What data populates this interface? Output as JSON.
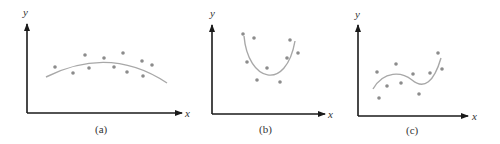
{
  "chart_data": [
    {
      "type": "scatter",
      "caption": "(a)",
      "xlabel": "x",
      "ylabel": "y",
      "description": "Scatter points with a quadratic (concave-down) fitted curve",
      "points": [
        [
          55,
          67
        ],
        [
          73,
          73
        ],
        [
          85,
          55
        ],
        [
          89,
          68
        ],
        [
          104,
          58
        ],
        [
          114,
          67
        ],
        [
          123,
          53
        ],
        [
          127,
          72
        ],
        [
          142,
          61
        ],
        [
          143,
          76
        ],
        [
          152,
          65
        ]
      ],
      "curve": "M46,77 Q110,45 167,83",
      "axes": {
        "origin": [
          27,
          113
        ],
        "y_top": 24,
        "x_right": 182
      },
      "labels": {
        "y_pos": [
          26,
          15
        ],
        "x_pos": [
          188,
          116
        ],
        "caption_pos": [
          103,
          132
        ]
      }
    },
    {
      "type": "scatter",
      "caption": "(b)",
      "xlabel": "x",
      "ylabel": "y",
      "description": "Scatter points with a U-shaped (concave-up) fitted curve",
      "points": [
        [
          243,
          34
        ],
        [
          254,
          38
        ],
        [
          247,
          62
        ],
        [
          267,
          68
        ],
        [
          257,
          80
        ],
        [
          280,
          82
        ],
        [
          287,
          58
        ],
        [
          290,
          40
        ],
        [
          298,
          53
        ]
      ],
      "curve": "M244,36 C248,82 286,92 295,41",
      "axes": {
        "origin": [
          212,
          114
        ],
        "y_top": 26,
        "x_right": 325
      },
      "labels": {
        "y_pos": [
          213,
          16
        ],
        "x_pos": [
          330,
          117
        ],
        "caption_pos": [
          267,
          132
        ]
      }
    },
    {
      "type": "scatter",
      "caption": "(c)",
      "xlabel": "x",
      "ylabel": "y",
      "description": "Scatter points with a cubic (S-shaped) fitted curve",
      "points": [
        [
          377,
          72
        ],
        [
          379,
          98
        ],
        [
          387,
          86
        ],
        [
          396,
          64
        ],
        [
          401,
          83
        ],
        [
          413,
          74
        ],
        [
          419,
          94
        ],
        [
          430,
          73
        ],
        [
          438,
          53
        ],
        [
          442,
          69
        ]
      ],
      "curve": "M373,89 C384,70 402,72 412,80 C424,90 434,82 441,58",
      "axes": {
        "origin": [
          358,
          116
        ],
        "y_top": 26,
        "x_right": 468
      },
      "labels": {
        "y_pos": [
          357,
          17
        ],
        "x_pos": [
          474,
          119
        ],
        "caption_pos": [
          414,
          133
        ]
      }
    }
  ],
  "figure": {
    "panels": [
      {
        "caption": "(a)",
        "x_label": "x",
        "y_label": "y"
      },
      {
        "caption": "(b)",
        "x_label": "x",
        "y_label": "y"
      },
      {
        "caption": "(c)",
        "x_label": "x",
        "y_label": "y"
      }
    ],
    "colors": {
      "axis": "#1a1a1a",
      "curve": "#a8a8a8",
      "points": "#8c8c8c"
    }
  }
}
